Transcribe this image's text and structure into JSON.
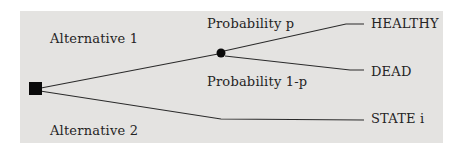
{
  "diagram": {
    "type": "decision-tree",
    "panel_color": "#e4e3e1",
    "line_color": "#2a2a2a",
    "node_color": "#0a0a0a",
    "branches": {
      "alternative_1": "Alternative 1",
      "alternative_2": "Alternative 2",
      "probability_p": "Probability p",
      "probability_1p": "Probability 1-p"
    },
    "outcomes": {
      "healthy": "HEALTHY",
      "dead": "DEAD",
      "state_i": "STATE i"
    },
    "nodes": {
      "decision_node": "square",
      "chance_node": "circle"
    }
  }
}
